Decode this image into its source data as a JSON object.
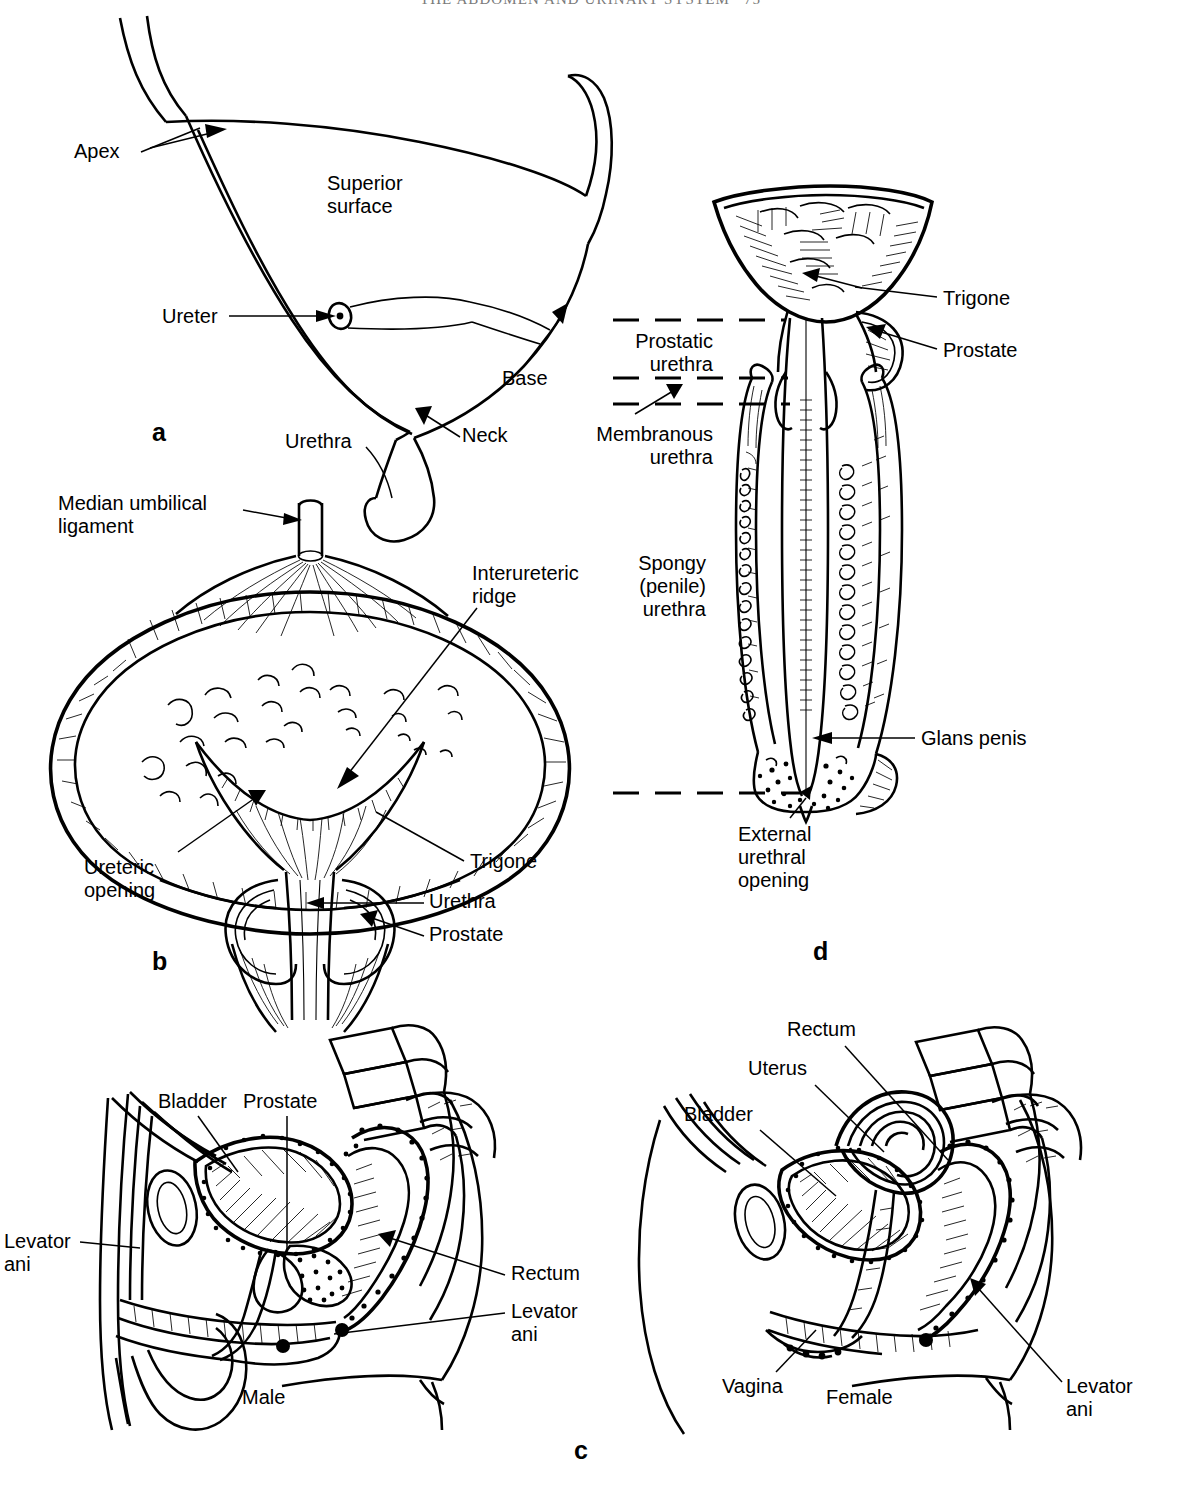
{
  "running_head": {
    "title": "THE ABDOMEN AND URINARY SYSTEM",
    "folio": "75"
  },
  "figure": {
    "panels": [
      {
        "id": "a",
        "letter": "a",
        "caption": "Lateral view of the urinary bladder",
        "labels": [
          "Apex",
          "Superior surface",
          "Ureter",
          "Base",
          "Urethra",
          "Neck"
        ]
      },
      {
        "id": "b",
        "letter": "b",
        "caption": "Coronal section of the bladder and prostate",
        "labels": [
          "Median umbilical ligament",
          "Interureteric ridge",
          "Ureteric opening",
          "Trigone",
          "Urethra",
          "Prostate"
        ]
      },
      {
        "id": "c",
        "letter": "c",
        "caption": "Sagittal sections of the male and female pelvis",
        "labels": [
          "Bladder",
          "Prostate",
          "Levator ani",
          "Rectum",
          "Male",
          "Uterus",
          "Vagina",
          "Female"
        ]
      },
      {
        "id": "d",
        "letter": "d",
        "caption": "The male urethra opened along its length",
        "labels": [
          "Trigone",
          "Prostate",
          "Prostatic urethra",
          "Membranous urethra",
          "Spongy (penile) urethra",
          "Glans penis",
          "External urethral opening"
        ]
      }
    ]
  },
  "panel_a": {
    "letter": "a",
    "apex": "Apex",
    "superior_surface": "Superior\nsurface",
    "ureter": "Ureter",
    "base": "Base",
    "urethra": "Urethra",
    "neck": "Neck"
  },
  "panel_b": {
    "letter": "b",
    "median_umbilical_ligament": "Median umbilical\nligament",
    "interureteric_ridge": "Interureteric\nridge",
    "ureteric_opening": "Ureteric\nopening",
    "trigone": "Trigone",
    "urethra": "Urethra",
    "prostate": "Prostate"
  },
  "panel_c": {
    "letter": "c",
    "male": {
      "bladder": "Bladder",
      "prostate": "Prostate",
      "levator_ani_left": "Levator\nani",
      "rectum": "Rectum",
      "levator_ani_right": "Levator\nani",
      "sex": "Male"
    },
    "female": {
      "rectum": "Rectum",
      "uterus": "Uterus",
      "bladder": "Bladder",
      "vagina": "Vagina",
      "levator_ani": "Levator\nani",
      "sex": "Female"
    }
  },
  "panel_d": {
    "letter": "d",
    "trigone": "Trigone",
    "prostate": "Prostate",
    "prostatic_urethra": "Prostatic\nurethra",
    "membranous_urethra": "Membranous\nurethra",
    "spongy_urethra": "Spongy\n(penile)\nurethra",
    "glans_penis": "Glans penis",
    "external_urethral_opening": "External\nurethral\nopening"
  },
  "colors": {
    "ink": "#000000",
    "paper": "#ffffff",
    "running_head": "#7a7a7a"
  }
}
